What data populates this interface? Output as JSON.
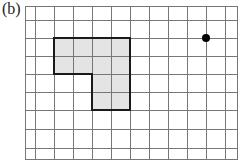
{
  "figure": {
    "label": "(b)",
    "grid": {
      "x_lines": [
        25,
        35,
        54,
        73,
        92,
        111,
        130,
        149,
        168,
        187,
        206,
        225,
        237
      ],
      "y_lines": [
        6,
        20,
        38,
        56,
        74,
        92,
        110,
        129,
        148,
        159
      ],
      "line_color": "#777777"
    },
    "shape": {
      "type": "L-shaped polygon",
      "points": "54,38 130,38 130,110 92,110 92,74 54,74",
      "fill": "#e4e4e4",
      "stroke": "#1a1a1a"
    },
    "dot": {
      "cx": 206,
      "cy": 38,
      "r": 4,
      "color": "#000000"
    }
  }
}
